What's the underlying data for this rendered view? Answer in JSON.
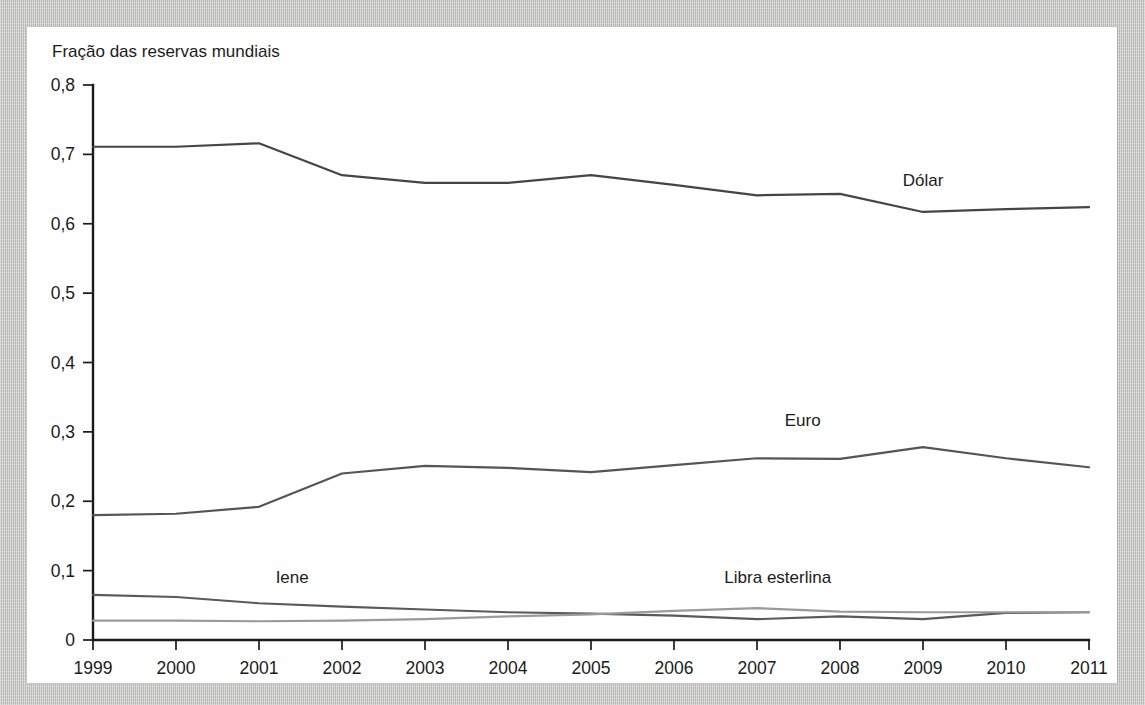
{
  "figure": {
    "y_axis_title": "Fração das reservas mundiais"
  },
  "chart_data": {
    "type": "line",
    "title": "",
    "subtitle": "",
    "xlabel": "",
    "ylabel": "Fração das reservas mundiais",
    "x": [
      1999,
      2000,
      2001,
      2002,
      2003,
      2004,
      2005,
      2006,
      2007,
      2008,
      2009,
      2010,
      2011
    ],
    "x_tick_labels": [
      "1999",
      "2000",
      "2001",
      "2002",
      "2003",
      "2004",
      "2005",
      "2006",
      "2007",
      "2008",
      "2009",
      "2010",
      "2011"
    ],
    "y_tick_labels": [
      "0",
      "0,1",
      "0,2",
      "0,3",
      "0,4",
      "0,5",
      "0,6",
      "0,7",
      "0,8"
    ],
    "y_tick_values": [
      0,
      0.1,
      0.2,
      0.3,
      0.4,
      0.5,
      0.6,
      0.7,
      0.8
    ],
    "xlim": [
      1999,
      2011
    ],
    "ylim": [
      0,
      0.8
    ],
    "grid": false,
    "legend_position": "inline-labels",
    "series": [
      {
        "name": "Dólar",
        "color": "#454545",
        "label_x": 2009,
        "label_y": 0.655,
        "values": [
          0.711,
          0.711,
          0.716,
          0.67,
          0.659,
          0.659,
          0.67,
          0.656,
          0.641,
          0.643,
          0.617,
          0.621,
          0.624
        ]
      },
      {
        "name": "Euro",
        "color": "#555555",
        "label_x": 2007.55,
        "label_y": 0.308,
        "values": [
          0.18,
          0.182,
          0.192,
          0.24,
          0.251,
          0.248,
          0.242,
          0.252,
          0.262,
          0.261,
          0.278,
          0.262,
          0.249
        ]
      },
      {
        "name": "Iene",
        "color": "#5a5a5a",
        "label_x": 2001.4,
        "label_y": 0.082,
        "values": [
          0.065,
          0.062,
          0.053,
          0.048,
          0.044,
          0.04,
          0.038,
          0.035,
          0.03,
          0.034,
          0.03,
          0.039,
          0.04
        ]
      },
      {
        "name": "Libra esterlina",
        "color": "#9a9a9a",
        "label_x": 2007.25,
        "label_y": 0.082,
        "values": [
          0.028,
          0.028,
          0.027,
          0.028,
          0.03,
          0.034,
          0.037,
          0.042,
          0.046,
          0.041,
          0.04,
          0.04,
          0.04
        ]
      }
    ]
  }
}
